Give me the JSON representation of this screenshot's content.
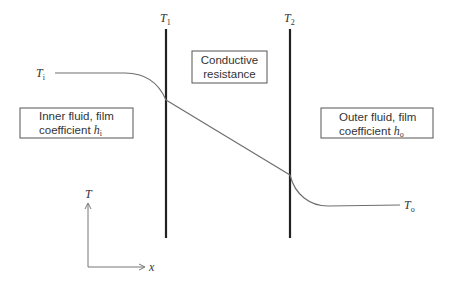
{
  "diagram": {
    "type": "temperature-profile-through-wall",
    "walls": [
      {
        "label_main": "T",
        "label_sub": "1"
      },
      {
        "label_main": "T",
        "label_sub": "2"
      }
    ],
    "inlet_temp": {
      "label_main": "T",
      "label_sub": "i"
    },
    "outlet_temp": {
      "label_main": "T",
      "label_sub": "o"
    },
    "boxes": {
      "inner": {
        "line1": "Inner fluid, film",
        "line2_text": "coefficient ",
        "line2_sym": "h",
        "line2_sub": "i"
      },
      "conductive": {
        "line1": "Conductive",
        "line2": "resistance"
      },
      "outer": {
        "line1": "Outer fluid, film",
        "line2_text": "coefficient ",
        "line2_sym": "h",
        "line2_sub": "o"
      }
    },
    "axes": {
      "y_label": "T",
      "x_label": "x"
    },
    "colors": {
      "wall": "#222222",
      "curve": "#6e6e6e",
      "box_border": "#555555",
      "axis": "#777777"
    }
  }
}
